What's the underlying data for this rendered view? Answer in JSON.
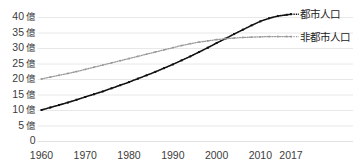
{
  "chart_data": {
    "type": "line",
    "title": "",
    "subtitle": "",
    "xlabel": "",
    "ylabel": "",
    "unit_suffix": "億",
    "grid": true,
    "legend_position": "right-inline",
    "xlim": [
      1960,
      2017
    ],
    "ylim": [
      0,
      42
    ],
    "x_ticks": [
      1960,
      1970,
      1980,
      1990,
      2000,
      2010,
      2017
    ],
    "x_tick_labels": [
      "1960",
      "1970",
      "1980",
      "1990",
      "2000",
      "2010",
      "2017"
    ],
    "y_ticks": [
      0,
      5,
      10,
      15,
      20,
      25,
      30,
      35,
      40
    ],
    "y_tick_labels": [
      "0",
      "5億",
      "10億",
      "15億",
      "20億",
      "25億",
      "30億",
      "35億",
      "40億"
    ],
    "x": [
      1960,
      1962,
      1964,
      1966,
      1968,
      1970,
      1972,
      1974,
      1976,
      1978,
      1980,
      1982,
      1984,
      1986,
      1988,
      1990,
      1992,
      1994,
      1996,
      1998,
      2000,
      2002,
      2004,
      2006,
      2008,
      2010,
      2012,
      2014,
      2016,
      2017
    ],
    "series": [
      {
        "name": "都市人口",
        "color": "#111111",
        "style": "dotted-marker",
        "values": [
          10.0,
          10.8,
          11.6,
          12.4,
          13.3,
          14.2,
          15.1,
          16.0,
          17.0,
          18.0,
          19.0,
          20.1,
          21.2,
          22.3,
          23.5,
          24.7,
          26.0,
          27.3,
          28.7,
          30.1,
          31.6,
          33.0,
          34.5,
          35.9,
          37.3,
          38.6,
          39.6,
          40.3,
          40.7,
          40.9
        ]
      },
      {
        "name": "非都市人口",
        "color": "#9a9a9a",
        "style": "dotted-marker",
        "values": [
          20.0,
          20.6,
          21.2,
          21.8,
          22.4,
          23.1,
          23.8,
          24.5,
          25.2,
          25.9,
          26.6,
          27.3,
          28.0,
          28.7,
          29.4,
          30.1,
          30.8,
          31.4,
          31.9,
          32.3,
          32.7,
          33.0,
          33.2,
          33.4,
          33.5,
          33.6,
          33.7,
          33.7,
          33.7,
          33.7
        ]
      }
    ],
    "crossover": {
      "year": 2007,
      "value": 33.4
    },
    "annotations": []
  },
  "legend": {
    "items": [
      {
        "label": "都市人口",
        "color": "#111111"
      },
      {
        "label": "非都市人口",
        "color": "#9a9a9a"
      }
    ]
  },
  "colors": {
    "background": "#ffffff",
    "grid": "#e2e2e2",
    "text": "#3c3c3c",
    "urban": "#111111",
    "rural": "#9a9a9a"
  }
}
